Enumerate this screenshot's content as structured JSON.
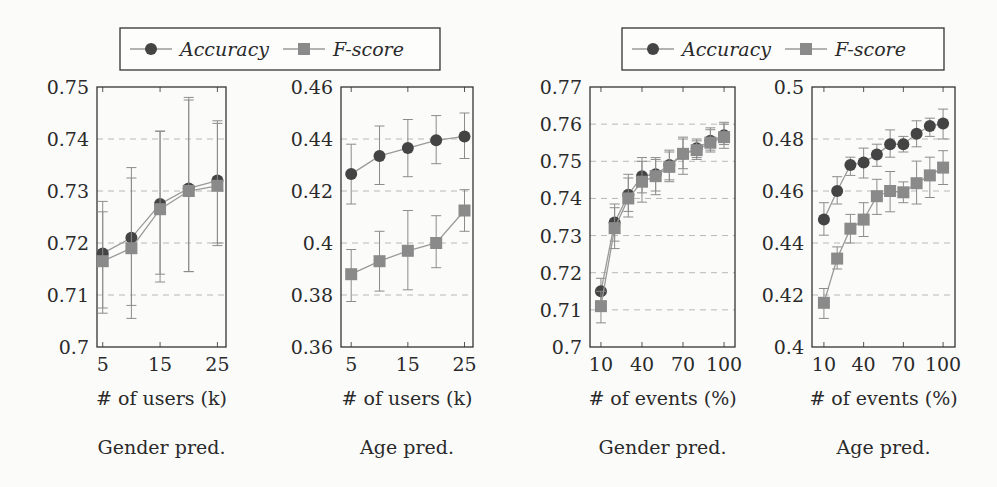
{
  "legends": [
    {
      "items": [
        {
          "label": "Accuracy",
          "marker": "circle",
          "color": "#444444"
        },
        {
          "label": "F-score",
          "marker": "square",
          "color": "#8a8a8a"
        }
      ]
    },
    {
      "items": [
        {
          "label": "Accuracy",
          "marker": "circle",
          "color": "#444444"
        },
        {
          "label": "F-score",
          "marker": "square",
          "color": "#8a8a8a"
        }
      ]
    }
  ],
  "chart_data": [
    {
      "type": "line",
      "title": "Gender pred.",
      "xlabel": "# of users (k)",
      "ylabel": "",
      "x": [
        5,
        10,
        15,
        20,
        25
      ],
      "xticks": [
        5,
        15,
        25
      ],
      "ylim": [
        0.7,
        0.75
      ],
      "yticks": [
        "0.7",
        "0.71",
        "0.72",
        "0.73",
        "0.74",
        "0.75"
      ],
      "grid": "dashed horizontal",
      "series": [
        {
          "name": "Accuracy",
          "values": [
            0.718,
            0.721,
            0.7275,
            0.7305,
            0.732
          ],
          "err_low": [
            0.7075,
            0.708,
            0.714,
            0.7145,
            0.72
          ],
          "err_high": [
            0.726,
            0.7325,
            0.7415,
            0.7475,
            0.743
          ]
        },
        {
          "name": "F-score",
          "values": [
            0.7165,
            0.719,
            0.7265,
            0.73,
            0.731
          ],
          "err_low": [
            0.7065,
            0.7055,
            0.7125,
            0.7145,
            0.7195
          ],
          "err_high": [
            0.728,
            0.7345,
            0.7415,
            0.748,
            0.7435
          ]
        }
      ]
    },
    {
      "type": "line",
      "title": "Age pred.",
      "xlabel": "# of users (k)",
      "ylabel": "",
      "x": [
        5,
        10,
        15,
        20,
        25
      ],
      "xticks": [
        5,
        15,
        25
      ],
      "ylim": [
        0.36,
        0.46
      ],
      "yticks": [
        "0.36",
        "0.38",
        "0.4",
        "0.42",
        "0.44",
        "0.46"
      ],
      "grid": "dashed horizontal",
      "series": [
        {
          "name": "Accuracy",
          "values": [
            0.4265,
            0.4335,
            0.4365,
            0.4395,
            0.441
          ],
          "err_low": [
            0.415,
            0.4225,
            0.4255,
            0.4305,
            0.4325
          ],
          "err_high": [
            0.438,
            0.445,
            0.4475,
            0.449,
            0.45
          ]
        },
        {
          "name": "F-score",
          "values": [
            0.388,
            0.393,
            0.397,
            0.4,
            0.4125
          ],
          "err_low": [
            0.3775,
            0.3815,
            0.382,
            0.3905,
            0.4045
          ],
          "err_high": [
            0.3975,
            0.4045,
            0.4125,
            0.4105,
            0.4205
          ]
        }
      ]
    },
    {
      "type": "line",
      "title": "Gender pred.",
      "xlabel": "# of events (%)",
      "ylabel": "",
      "x": [
        10,
        20,
        30,
        40,
        50,
        60,
        70,
        80,
        90,
        100
      ],
      "xticks": [
        10,
        40,
        70,
        100
      ],
      "ylim": [
        0.7,
        0.77
      ],
      "yticks": [
        "0.7",
        "0.71",
        "0.72",
        "0.73",
        "0.74",
        "0.75",
        "0.76",
        "0.77"
      ],
      "grid": "dashed horizontal",
      "series": [
        {
          "name": "Accuracy",
          "values": [
            0.715,
            0.7335,
            0.741,
            0.746,
            0.7465,
            0.749,
            0.752,
            0.7535,
            0.7555,
            0.757
          ],
          "err_low": [
            0.7115,
            0.7285,
            0.7365,
            0.7415,
            0.742,
            0.745,
            0.748,
            0.751,
            0.753,
            0.7545
          ],
          "err_high": [
            0.7185,
            0.7385,
            0.7465,
            0.751,
            0.751,
            0.753,
            0.7565,
            0.756,
            0.759,
            0.7605
          ]
        },
        {
          "name": "F-score",
          "values": [
            0.711,
            0.732,
            0.74,
            0.7445,
            0.746,
            0.7485,
            0.752,
            0.753,
            0.755,
            0.7565
          ],
          "err_low": [
            0.7065,
            0.7265,
            0.735,
            0.739,
            0.741,
            0.7445,
            0.7465,
            0.7505,
            0.7525,
            0.7535
          ],
          "err_high": [
            0.715,
            0.7375,
            0.7455,
            0.75,
            0.7505,
            0.7525,
            0.756,
            0.7555,
            0.7585,
            0.76
          ]
        }
      ]
    },
    {
      "type": "line",
      "title": "Age pred.",
      "xlabel": "# of events (%)",
      "ylabel": "",
      "x": [
        10,
        20,
        30,
        40,
        50,
        60,
        70,
        80,
        90,
        100
      ],
      "xticks": [
        10,
        40,
        70,
        100
      ],
      "ylim": [
        0.4,
        0.5
      ],
      "yticks": [
        "0.4",
        "0.42",
        "0.44",
        "0.46",
        "0.48",
        "0.5"
      ],
      "grid": "dashed horizontal",
      "series": [
        {
          "name": "Accuracy",
          "values": [
            0.449,
            0.46,
            0.47,
            0.471,
            0.474,
            0.478,
            0.478,
            0.482,
            0.485,
            0.486
          ],
          "err_low": [
            0.443,
            0.455,
            0.466,
            0.465,
            0.4695,
            0.473,
            0.475,
            0.477,
            0.481,
            0.48
          ],
          "err_high": [
            0.4555,
            0.4655,
            0.473,
            0.4765,
            0.478,
            0.4835,
            0.481,
            0.487,
            0.488,
            0.4915
          ]
        },
        {
          "name": "F-score",
          "values": [
            0.417,
            0.434,
            0.4455,
            0.449,
            0.458,
            0.46,
            0.4595,
            0.463,
            0.466,
            0.469
          ],
          "err_low": [
            0.411,
            0.43,
            0.44,
            0.4425,
            0.451,
            0.452,
            0.4555,
            0.455,
            0.4575,
            0.4625
          ],
          "err_high": [
            0.4225,
            0.4385,
            0.451,
            0.4555,
            0.4645,
            0.4675,
            0.4635,
            0.4715,
            0.473,
            0.4755
          ]
        }
      ]
    }
  ]
}
